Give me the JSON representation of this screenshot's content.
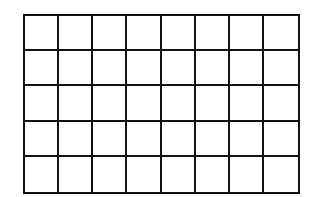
{
  "grid": {
    "rows": 5,
    "columns": 8,
    "line_color": "#111111",
    "fill_color": "#ffffff"
  }
}
